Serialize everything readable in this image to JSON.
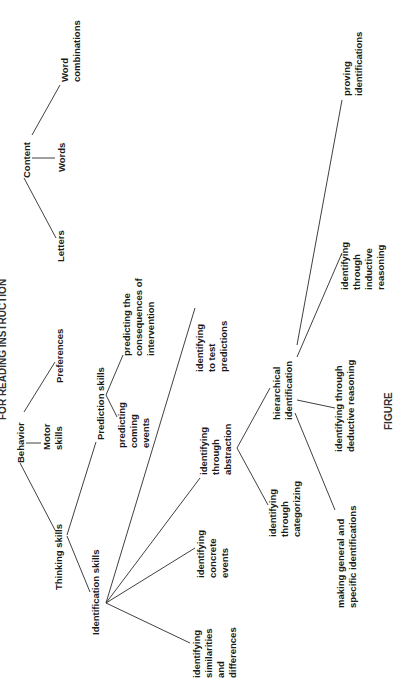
{
  "title": "FOR READING INSTRUCTION",
  "caption": "FIGURE",
  "nodes": {
    "content": [
      "Content"
    ],
    "letters": [
      "Letters"
    ],
    "words": [
      "Words"
    ],
    "word_combinations": [
      "Word",
      "combinations"
    ],
    "behavior": [
      "Behavior"
    ],
    "motor_skills": [
      "Motor",
      "skills"
    ],
    "preferences": [
      "Preferences"
    ],
    "thinking_skills": [
      "Thinking skills"
    ],
    "prediction_skills": [
      "Prediction skills"
    ],
    "predicting_coming_events": [
      "predicting",
      "coming",
      "events"
    ],
    "predicting_consequences": [
      "predicting the",
      "consequences of",
      "intervention"
    ],
    "identification_skills": [
      "Identification skills"
    ],
    "identifying_similarities": [
      "identifying",
      "similarities",
      "and",
      "differences"
    ],
    "identifying_concrete": [
      "identifying",
      "concrete",
      "events"
    ],
    "identifying_abstraction": [
      "identifying",
      "through",
      "abstraction"
    ],
    "identifying_test_predictions": [
      "identifying",
      "to test",
      "predictions"
    ],
    "identifying_categorizing": [
      "identifying",
      "through",
      "categorizing"
    ],
    "hierarchical_identification": [
      "hierarchical",
      "identification"
    ],
    "making_general_specific": [
      "making general and",
      "specific identifications"
    ],
    "identifying_deductive": [
      "identifying through",
      "deductive reasoning"
    ],
    "identifying_inductive": [
      "identifying",
      "through",
      "inductive",
      "reasoning"
    ],
    "proving_identifications": [
      "proving",
      "identifications"
    ]
  }
}
